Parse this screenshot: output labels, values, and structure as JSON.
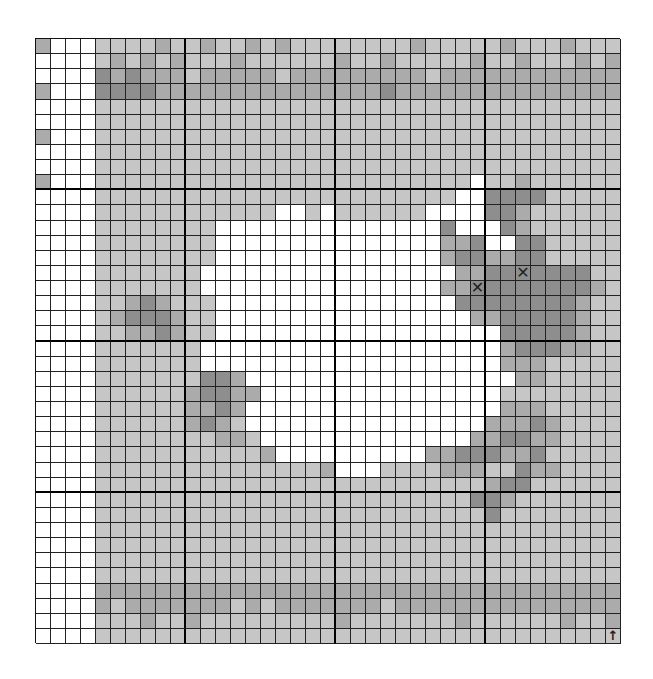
{
  "board": {
    "columns": 39,
    "rows": 40,
    "thick_line_every": 10,
    "legend": {
      "W": {
        "name": "empty",
        "color": "#ffffff"
      },
      "1": {
        "name": "light",
        "color": "#c6c6c6"
      },
      "2": {
        "name": "medium",
        "color": "#ababab"
      },
      "3": {
        "name": "dark",
        "color": "#8e8e8e"
      }
    },
    "grid": [
      "2WWW11112112112121111111121111121112111",
      "WWWW12121211121111112112111112112111212",
      "WWWW32322212222212222222221222222222222",
      "2WWW33332222222222222223222222222222222",
      "WWWW11111111111111111111111111111111111",
      "WWWW11111111111111111111111111111111111",
      "2WWW11111111111111111111111111111111111",
      "WWWW11111111111111111111111111111111111",
      "WWWW11111111111111111111111111111111111",
      "2WWW1111111111111111111111111W1121111111",
      "WWWW111111111111111111111111WW3333111111",
      "WWWW111111111111WW1W111111WWWW3321111111",
      "WWWW11111111WWWWWWWWWWWWWWW3WWW3211111",
      "WWWW11111111WWWWWWWWWWWWWWW223WW3311111",
      "WWWW11111111WWWWWWWWWWWWWWW233223311111",
      "WWWW1111111WWWWWWWWWWWWWWWWW2233333X3111",
      "WWWW1111111WWWWWWWWWWWWWWWW2233X333332111",
      "WWWW11232111WWWWWWWWWWWWWWWW333333332111",
      "WWWW12333211WWWWWWWWWWWWWWWWW22333332111",
      "WWWW11223211WWWWWWWWWWWWWWWWWWW3333321111",
      "WWWW1111111WWWWWWWWWWWWWWWWWWWW2333221111",
      "WWWW1111111WWWWWWWWWWWWWWWWWWWW2221111111",
      "WWWW1111111332WWWWWWWWWWWWWWWWWW221111111",
      "WWWW11111123322WWWWWWWWWWWWWWWW1111111111",
      "WWWW1111112232WWWWWWWWWWWWWWWWW2221111111",
      "WWWW1111112321WWWWWWWWWWWWWWWW22232111111",
      "WWWW11111111221WWWWWWWWWWWWWW223322111111",
      "WWWW111111111112WWWWWWWWWW22333223111111",
      "WWWW1111111111111112WWW111122211322111111",
      "WWWW111111111111111111111111112331111111",
      "WWWW111111111111111111111111133211111111",
      "WWWW111111111111111111111111113111111111",
      "WWWW11111111111111111111111111111111111",
      "WWWW11111111111111111111111111111111111",
      "WWWW11111111111111111111111111111111111",
      "WWWW11111111111111111111111111111111111",
      "WWWW22222222222222222222222222222222222",
      "WWWW21222222212122222221222222222222222",
      "WWWW11121121111111112111111121111112112",
      "WWWW11111111111111111111111111111111111"
    ],
    "markers": [
      {
        "type": "cross-icon",
        "glyph": "✕",
        "row": 16,
        "col": 29
      },
      {
        "type": "cross-icon",
        "glyph": "✕",
        "row": 15,
        "col": 32
      },
      {
        "type": "arrow-up-icon",
        "glyph": "↑",
        "row": 39,
        "col": 38
      }
    ]
  }
}
